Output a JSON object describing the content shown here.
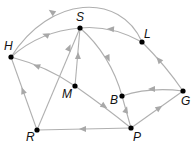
{
  "diagram": {
    "type": "directed-graph",
    "colors": {
      "edge": "#b0b0b0",
      "arrow": "#a8a8a8",
      "node": "#000000",
      "label": "#111111"
    },
    "nodes": [
      {
        "id": "H",
        "label": "H",
        "x": 11,
        "y": 57,
        "lx": 4,
        "ly": 50
      },
      {
        "id": "S",
        "label": "S",
        "x": 80,
        "y": 28,
        "lx": 76,
        "ly": 21
      },
      {
        "id": "L",
        "label": "L",
        "x": 142,
        "y": 42,
        "lx": 144,
        "ly": 38
      },
      {
        "id": "M",
        "label": "M",
        "x": 75,
        "y": 86,
        "lx": 62,
        "ly": 98
      },
      {
        "id": "B",
        "label": "B",
        "x": 122,
        "y": 96,
        "lx": 110,
        "ly": 104
      },
      {
        "id": "G",
        "label": "G",
        "x": 183,
        "y": 91,
        "lx": 181,
        "ly": 105
      },
      {
        "id": "R",
        "label": "R",
        "x": 37,
        "y": 130,
        "lx": 26,
        "ly": 141
      },
      {
        "id": "P",
        "label": "P",
        "x": 131,
        "y": 128,
        "lx": 133,
        "ly": 141
      }
    ],
    "edges": [
      {
        "from": "L",
        "to": "H",
        "path": "M142,42 C120,-8 50,-5 11,57"
      },
      {
        "from": "L",
        "to": "S",
        "path": "M142,42 C120,30 100,26 80,28"
      },
      {
        "from": "S",
        "to": "H",
        "path": "M80,28 C55,30 30,40 11,57"
      },
      {
        "from": "G",
        "to": "L",
        "path": "M183,91 C170,72 155,55 142,42"
      },
      {
        "from": "G",
        "to": "B",
        "path": "M183,91 C160,88 140,90 122,96"
      },
      {
        "from": "P",
        "to": "G",
        "path": "M131,128 L183,91"
      },
      {
        "from": "P",
        "to": "B",
        "path": "M131,128 L122,96"
      },
      {
        "from": "S",
        "to": "B",
        "path": "M80,28 C100,45 115,70 122,96"
      },
      {
        "from": "P",
        "to": "R",
        "path": "M131,128 L37,130"
      },
      {
        "from": "R",
        "to": "H",
        "path": "M37,130 L11,57"
      },
      {
        "from": "R",
        "to": "S",
        "path": "M37,130 L80,28"
      },
      {
        "from": "M",
        "to": "S",
        "path": "M75,86 L80,28"
      },
      {
        "from": "M",
        "to": "H",
        "path": "M75,86 C55,72 30,62 11,57"
      },
      {
        "from": "M",
        "to": "P",
        "path": "M75,86 C95,100 115,115 131,128"
      }
    ],
    "arrows": [
      {
        "edge": "L-H",
        "x": 52,
        "y": 12,
        "angle": 215
      },
      {
        "edge": "L-S",
        "x": 111,
        "y": 29,
        "angle": 185
      },
      {
        "edge": "S-H",
        "x": 46,
        "y": 35,
        "angle": 200
      },
      {
        "edge": "G-L",
        "x": 159,
        "y": 60,
        "angle": 230
      },
      {
        "edge": "G-B",
        "x": 152,
        "y": 89,
        "angle": 180
      },
      {
        "edge": "P-G",
        "x": 159,
        "y": 108,
        "angle": 325
      },
      {
        "edge": "P-B",
        "x": 126,
        "y": 110,
        "angle": 285
      },
      {
        "edge": "S-B",
        "x": 108,
        "y": 58,
        "angle": 65
      },
      {
        "edge": "P-R",
        "x": 83,
        "y": 129,
        "angle": 180
      },
      {
        "edge": "R-H",
        "x": 23,
        "y": 91,
        "angle": 250
      },
      {
        "edge": "R-S",
        "x": 69,
        "y": 48,
        "angle": 293
      },
      {
        "edge": "M-S",
        "x": 78,
        "y": 56,
        "angle": 272
      },
      {
        "edge": "M-H",
        "x": 37,
        "y": 66,
        "angle": 200
      },
      {
        "edge": "M-P",
        "x": 104,
        "y": 106,
        "angle": 35
      }
    ]
  }
}
